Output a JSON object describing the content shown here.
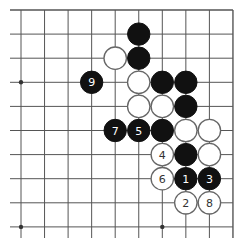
{
  "diagram": {
    "type": "go-board-fragment",
    "visible_columns": 10,
    "visible_rows": 10,
    "edges": {
      "top": true,
      "right": true,
      "left": false,
      "bottom": false
    },
    "star_points": [
      {
        "col": 0,
        "row": 3
      },
      {
        "col": 0,
        "row": 9
      },
      {
        "col": 6,
        "row": 9
      }
    ],
    "stones": [
      {
        "color": "black",
        "col": 5,
        "row": 1,
        "label": ""
      },
      {
        "color": "white",
        "col": 4,
        "row": 2,
        "label": ""
      },
      {
        "color": "black",
        "col": 5,
        "row": 2,
        "label": ""
      },
      {
        "color": "black",
        "col": 3,
        "row": 3,
        "label": "9"
      },
      {
        "color": "white",
        "col": 5,
        "row": 3,
        "label": ""
      },
      {
        "color": "black",
        "col": 6,
        "row": 3,
        "label": ""
      },
      {
        "color": "black",
        "col": 7,
        "row": 3,
        "label": ""
      },
      {
        "color": "white",
        "col": 5,
        "row": 4,
        "label": ""
      },
      {
        "color": "white",
        "col": 6,
        "row": 4,
        "label": ""
      },
      {
        "color": "black",
        "col": 7,
        "row": 4,
        "label": ""
      },
      {
        "color": "black",
        "col": 4,
        "row": 5,
        "label": "7"
      },
      {
        "color": "black",
        "col": 5,
        "row": 5,
        "label": "5"
      },
      {
        "color": "black",
        "col": 6,
        "row": 5,
        "label": ""
      },
      {
        "color": "white",
        "col": 7,
        "row": 5,
        "label": ""
      },
      {
        "color": "white",
        "col": 8,
        "row": 5,
        "label": ""
      },
      {
        "color": "white",
        "col": 6,
        "row": 6,
        "label": "4"
      },
      {
        "color": "black",
        "col": 7,
        "row": 6,
        "label": ""
      },
      {
        "color": "white",
        "col": 8,
        "row": 6,
        "label": ""
      },
      {
        "color": "white",
        "col": 6,
        "row": 7,
        "label": "6"
      },
      {
        "color": "black",
        "col": 7,
        "row": 7,
        "label": "1"
      },
      {
        "color": "black",
        "col": 8,
        "row": 7,
        "label": "3"
      },
      {
        "color": "white",
        "col": 7,
        "row": 8,
        "label": "2"
      },
      {
        "color": "white",
        "col": 8,
        "row": 8,
        "label": "8"
      }
    ]
  }
}
